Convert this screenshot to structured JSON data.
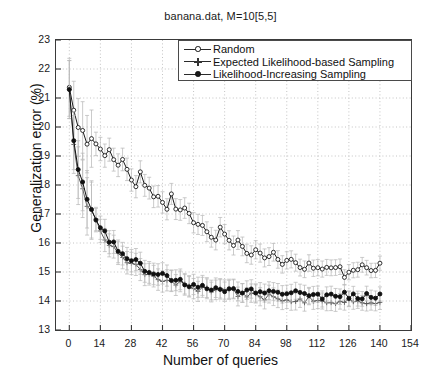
{
  "chart_data": {
    "type": "line",
    "title": "banana.dat, M=10[5,5]",
    "xlabel": "Number of queries",
    "ylabel": "Generalization error (%)",
    "xlim": [
      -6,
      154
    ],
    "ylim": [
      13,
      23
    ],
    "xticks": [
      0,
      14,
      28,
      42,
      56,
      70,
      84,
      98,
      112,
      126,
      140,
      154
    ],
    "yticks": [
      13,
      14,
      15,
      16,
      17,
      18,
      19,
      20,
      21,
      22,
      23
    ],
    "grid": "dotted-horizontal-and-vertical",
    "legend_position": "top-right",
    "errorbars": true,
    "errorbar_color": "#b9b9b9",
    "x": [
      0,
      2,
      4,
      6,
      8,
      10,
      12,
      14,
      16,
      18,
      20,
      22,
      24,
      26,
      28,
      30,
      32,
      34,
      36,
      38,
      40,
      42,
      44,
      46,
      48,
      50,
      52,
      54,
      56,
      58,
      60,
      62,
      64,
      66,
      68,
      70,
      72,
      74,
      76,
      78,
      80,
      82,
      84,
      86,
      88,
      90,
      92,
      94,
      96,
      98,
      100,
      102,
      104,
      106,
      108,
      110,
      112,
      114,
      116,
      118,
      120,
      122,
      124,
      126,
      128,
      130,
      132,
      134,
      136,
      138,
      140
    ],
    "series": [
      {
        "name": "Random",
        "marker": "open-circle",
        "color": "#1a1a1a",
        "values": [
          21.35,
          20.55,
          19.95,
          19.75,
          19.55,
          19.7,
          19.35,
          19.25,
          19.05,
          19.2,
          18.85,
          18.6,
          18.8,
          18.55,
          18.3,
          18.1,
          18.35,
          18.05,
          17.85,
          17.6,
          17.75,
          17.45,
          17.3,
          17.55,
          17.25,
          17.05,
          17.2,
          16.95,
          16.8,
          16.6,
          16.75,
          16.5,
          16.35,
          16.2,
          16.4,
          16.15,
          16.0,
          15.85,
          16.05,
          15.85,
          15.7,
          15.6,
          15.8,
          15.6,
          15.5,
          15.4,
          15.6,
          15.45,
          15.35,
          15.25,
          15.45,
          15.3,
          15.2,
          15.1,
          15.3,
          15.15,
          15.05,
          15.2,
          15.1,
          15.0,
          15.15,
          15.05,
          14.95,
          15.1,
          15.2,
          15.1,
          15.15,
          15.25,
          15.2,
          15.15,
          15.2
        ]
      },
      {
        "name": "Expected Likelihood-based Sampling",
        "marker": "plus",
        "color": "#5a5a5a",
        "values": [
          21.3,
          19.4,
          18.35,
          17.85,
          17.35,
          17.05,
          16.7,
          16.45,
          16.2,
          16.0,
          15.85,
          15.65,
          15.55,
          15.4,
          15.3,
          15.2,
          15.1,
          15.0,
          14.95,
          14.85,
          14.8,
          14.75,
          14.7,
          14.65,
          14.6,
          14.6,
          14.55,
          14.5,
          14.5,
          14.45,
          14.45,
          14.4,
          14.4,
          14.35,
          14.35,
          14.3,
          14.3,
          14.3,
          14.25,
          14.25,
          14.25,
          14.2,
          14.2,
          14.2,
          14.15,
          14.15,
          14.15,
          14.1,
          14.1,
          14.1,
          14.1,
          14.05,
          14.05,
          14.05,
          14.05,
          14.0,
          14.0,
          14.05,
          14.0,
          14.0,
          14.0,
          13.95,
          14.0,
          13.95,
          14.0,
          13.95,
          13.95,
          14.0,
          13.95,
          13.95,
          14.0
        ]
      },
      {
        "name": "Likelihood-Increasing Sampling",
        "marker": "filled-circle",
        "color": "#111111",
        "values": [
          21.3,
          19.55,
          18.5,
          18.05,
          17.55,
          17.25,
          16.9,
          16.6,
          16.35,
          16.15,
          15.95,
          15.8,
          15.65,
          15.55,
          15.45,
          15.3,
          15.25,
          15.15,
          15.05,
          15.0,
          14.95,
          14.85,
          14.85,
          14.75,
          14.75,
          14.7,
          14.65,
          14.6,
          14.6,
          14.55,
          14.55,
          14.5,
          14.5,
          14.5,
          14.45,
          14.45,
          14.45,
          14.4,
          14.4,
          14.4,
          14.35,
          14.35,
          14.35,
          14.35,
          14.3,
          14.3,
          14.3,
          14.3,
          14.3,
          14.25,
          14.3,
          14.25,
          14.25,
          14.25,
          14.25,
          14.2,
          14.25,
          14.2,
          14.2,
          14.25,
          14.2,
          14.2,
          14.2,
          14.15,
          14.2,
          14.2,
          14.15,
          14.2,
          14.2,
          14.15,
          14.2
        ]
      }
    ]
  }
}
